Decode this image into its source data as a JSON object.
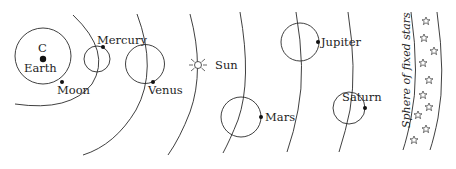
{
  "diagram": {
    "labels": {
      "center": "C",
      "earth": "Earth",
      "moon": "Moon",
      "mercury": "Mercury",
      "venus": "Venus",
      "sun": "Sun",
      "mars": "Mars",
      "jupiter": "Jupiter",
      "saturn": "Saturn",
      "fixed_stars": "Sphere of fixed stars"
    },
    "colors": {
      "line": "#2a2a2a",
      "text": "#1e1e1e",
      "background": "#ffffff"
    },
    "star_count": 10
  }
}
